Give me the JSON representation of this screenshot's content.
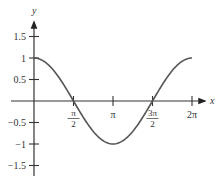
{
  "chart_data": {
    "type": "line",
    "title": "",
    "xlabel": "x",
    "ylabel": "y",
    "function": "cos(x)",
    "xlim": [
      0,
      6.2832
    ],
    "ylim": [
      -1.5,
      1.5
    ],
    "grid": false,
    "legend": null,
    "x_ticks": [
      {
        "value": 1.5708,
        "label_num": "π",
        "label_den": "2",
        "fraction": true
      },
      {
        "value": 3.1416,
        "label": "π",
        "fraction": false
      },
      {
        "value": 4.7124,
        "label_num": "3π",
        "label_den": "2",
        "fraction": true
      },
      {
        "value": 6.2832,
        "label": "2π",
        "fraction": false
      }
    ],
    "y_ticks": [
      {
        "value": 1.5,
        "label": "1.5"
      },
      {
        "value": 1,
        "label": "1"
      },
      {
        "value": 0.5,
        "label": "0.5"
      },
      {
        "value": -0.5,
        "label": "−0.5"
      },
      {
        "value": -1,
        "label": "−1"
      },
      {
        "value": -1.5,
        "label": "−1.5"
      }
    ],
    "series": [
      {
        "name": "y = cos x",
        "x": [
          0,
          0.7854,
          1.5708,
          2.3562,
          3.1416,
          3.927,
          4.7124,
          5.4978,
          6.2832
        ],
        "y": [
          1,
          0.7071,
          0,
          -0.7071,
          -1,
          -0.7071,
          0,
          0.7071,
          1
        ],
        "color": "#555555"
      }
    ]
  },
  "colors": {
    "axis": "#333333",
    "curve": "#555555"
  }
}
